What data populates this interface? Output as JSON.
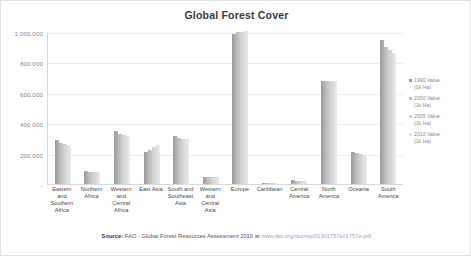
{
  "chart_data": {
    "type": "bar",
    "title": "Global Forest Cover",
    "xlabel": "",
    "ylabel": "",
    "ylim": [
      0,
      1000000
    ],
    "grid": true,
    "legend_position": "right",
    "y_ticks": [
      "1.000.000",
      "800.000",
      "600.000",
      "400.000",
      "200.000",
      "-"
    ],
    "y_tick_values": [
      1000000,
      800000,
      600000,
      400000,
      200000,
      0
    ],
    "categories": [
      "Eastern and Southern Africa",
      "Northern Africa",
      "Western and Central Africa",
      "East Asia",
      "South and Southeast Asia",
      "Western and Central Asia",
      "Europe",
      "Caribbean",
      "Central America",
      "North America",
      "Oceania",
      "South America"
    ],
    "series": [
      {
        "name": "1990 Value (1k Ha)",
        "color": "#9b9b9b",
        "values": [
          288000,
          85000,
          346000,
          209000,
          319000,
          43000,
          989000,
          5900,
          26000,
          677000,
          212000,
          946000
        ]
      },
      {
        "name": "2000 Value (1k Ha)",
        "color": "#bdbdbd",
        "values": [
          271000,
          79000,
          330000,
          227000,
          302000,
          43000,
          998000,
          6300,
          22000,
          677000,
          207000,
          904000
        ]
      },
      {
        "name": "2005 Value (1k Ha)",
        "color": "#d2d2d2",
        "values": [
          263000,
          78000,
          322000,
          241000,
          296000,
          43000,
          1001000,
          6600,
          20000,
          677000,
          200000,
          882000
        ]
      },
      {
        "name": "2010 Value (1k Ha)",
        "color": "#e2e2e2",
        "values": [
          255000,
          78000,
          313000,
          254000,
          294000,
          43000,
          1005000,
          6900,
          19000,
          679000,
          191000,
          864000
        ]
      }
    ],
    "source": {
      "label": "Source:",
      "text": "FAO - Global Forest Resources Assessment 2010 at",
      "url": "www.fao.org/docrep/013/i1757e/i1757e.pdf"
    }
  }
}
